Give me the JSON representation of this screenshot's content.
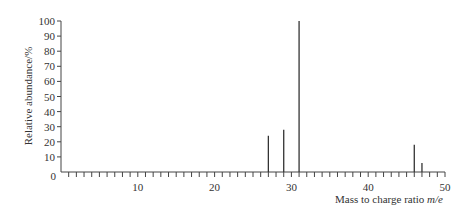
{
  "chart_data": {
    "type": "bar",
    "title": "",
    "xlabel": "Mass to charge ratio m/e",
    "xlabel_main": "Mass to charge ratio ",
    "xlabel_italic": "m/e",
    "ylabel": "Relative abundance/%",
    "xlim": [
      0,
      50
    ],
    "ylim": [
      0,
      100
    ],
    "x_ticks": [
      10,
      20,
      30,
      40,
      50
    ],
    "x_origin_label": "0",
    "y_ticks": [
      10,
      20,
      30,
      40,
      50,
      60,
      70,
      80,
      90,
      100
    ],
    "grid": false,
    "legend": null,
    "x": [
      27,
      29,
      31,
      46,
      47
    ],
    "values": [
      24,
      28,
      100,
      18,
      6
    ]
  }
}
